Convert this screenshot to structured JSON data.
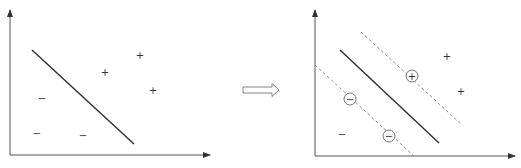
{
  "diagram": {
    "colors": {
      "axis": "#555555",
      "line": "#333333",
      "dashed": "#888888",
      "circle": "#666666",
      "symbol": "#333333",
      "arrow": "#777777"
    },
    "left_panel": {
      "name": "arbitrary separating line",
      "decision_line": {
        "x1": 32,
        "y1": 50,
        "x2": 134,
        "y2": 144
      },
      "positives": [
        {
          "label": "+",
          "x": 105,
          "y": 73
        },
        {
          "label": "+",
          "x": 140,
          "y": 56
        },
        {
          "label": "+",
          "x": 153,
          "y": 91
        }
      ],
      "negatives": [
        {
          "label": "−",
          "x": 42,
          "y": 99
        },
        {
          "label": "−",
          "x": 37,
          "y": 134
        },
        {
          "label": "−",
          "x": 83,
          "y": 136
        }
      ]
    },
    "transition_arrow": {
      "label": "⇒"
    },
    "right_panel": {
      "name": "maximum margin hyperplane with support vectors",
      "decision_line": {
        "x1": 340,
        "y1": 50,
        "x2": 439,
        "y2": 143
      },
      "margin_upper": {
        "x1": 361,
        "y1": 32,
        "x2": 462,
        "y2": 125
      },
      "margin_lower": {
        "x1": 315,
        "y1": 65,
        "x2": 415,
        "y2": 157
      },
      "support_vectors": [
        {
          "label": "+",
          "x": 412,
          "y": 76
        },
        {
          "label": "−",
          "x": 350,
          "y": 99
        },
        {
          "label": "−",
          "x": 389,
          "y": 136
        }
      ],
      "positives": [
        {
          "label": "+",
          "x": 447,
          "y": 57
        },
        {
          "label": "+",
          "x": 461,
          "y": 92
        }
      ],
      "negatives": [
        {
          "label": "−",
          "x": 342,
          "y": 135
        }
      ]
    }
  }
}
